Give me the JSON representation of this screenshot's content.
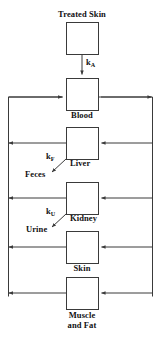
{
  "diagram": {
    "type": "compartment-flow-diagram",
    "title_visible": false,
    "colors": {
      "line": "#3a3a3a",
      "text": "#111111",
      "background": "#ffffff"
    },
    "compartments": [
      {
        "id": "treated-skin",
        "label": "Treated Skin",
        "label_position": "above"
      },
      {
        "id": "blood",
        "label": "Blood",
        "label_position": "below"
      },
      {
        "id": "liver",
        "label": "Liver",
        "label_position": "below-right"
      },
      {
        "id": "kidney",
        "label": "Kidney",
        "label_position": "below-right"
      },
      {
        "id": "skin",
        "label": "Skin",
        "label_position": "below"
      },
      {
        "id": "muscle-and-fat",
        "label_line1": "Muscle",
        "label_line2": "and Fat",
        "label": "Muscle and Fat",
        "label_position": "below"
      }
    ],
    "rate_constants": [
      {
        "id": "k-a",
        "base": "k",
        "subscript": "A",
        "label": "kA",
        "from": "treated-skin",
        "to": "blood"
      },
      {
        "id": "k-f",
        "base": "k",
        "subscript": "F",
        "label": "kF",
        "from": "liver",
        "to": "feces"
      },
      {
        "id": "k-u",
        "base": "k",
        "subscript": "U",
        "label": "kU",
        "from": "kidney",
        "to": "urine"
      }
    ],
    "excretion_outputs": [
      {
        "id": "feces",
        "label": "Feces",
        "source": "liver"
      },
      {
        "id": "urine",
        "label": "Urine",
        "source": "kidney"
      }
    ],
    "flows": [
      {
        "from": "treated-skin",
        "to": "blood",
        "direction": "down",
        "rate": "kA"
      },
      {
        "from": "blood",
        "to": "right-bus",
        "direction": "right"
      },
      {
        "from": "left-bus",
        "to": "blood",
        "direction": "right"
      },
      {
        "from": "right-bus",
        "to": "liver",
        "direction": "left"
      },
      {
        "from": "liver",
        "to": "left-bus",
        "direction": "left"
      },
      {
        "from": "right-bus",
        "to": "kidney",
        "direction": "left"
      },
      {
        "from": "kidney",
        "to": "left-bus",
        "direction": "left"
      },
      {
        "from": "right-bus",
        "to": "skin",
        "direction": "left"
      },
      {
        "from": "skin",
        "to": "left-bus",
        "direction": "left"
      },
      {
        "from": "right-bus",
        "to": "muscle-and-fat",
        "direction": "left"
      },
      {
        "from": "muscle-and-fat",
        "to": "left-bus",
        "direction": "left"
      },
      {
        "from": "liver",
        "to": "feces",
        "direction": "down-left",
        "rate": "kF"
      },
      {
        "from": "kidney",
        "to": "urine",
        "direction": "down-left",
        "rate": "kU"
      }
    ]
  }
}
